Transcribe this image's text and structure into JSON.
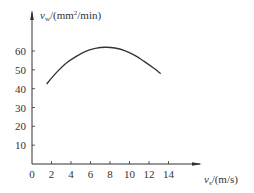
{
  "chart_data": {
    "type": "line",
    "title": "",
    "xlabel": "v_s/(m/s)",
    "ylabel": "v_w/(mm²/min)",
    "xlabel_parts": {
      "symbol": "v",
      "sub": "s",
      "unit": "/(m/s)"
    },
    "ylabel_parts": {
      "symbol": "v",
      "sub": "w",
      "unit_pre": "/(mm",
      "sup": "2",
      "unit_post": "/min)"
    },
    "xlim": [
      0,
      15
    ],
    "ylim": [
      0,
      70
    ],
    "x_ticks": [
      0,
      2,
      4,
      6,
      8,
      10,
      12,
      14
    ],
    "y_ticks": [
      10,
      20,
      30,
      40,
      50,
      60
    ],
    "grid": false,
    "legend": null,
    "series": [
      {
        "name": "v_w vs v_s",
        "x": [
          1.5,
          2.5,
          3.5,
          4.5,
          5.5,
          6.5,
          7.5,
          8.5,
          9.5,
          10.5,
          11.5,
          12.5,
          13.2
        ],
        "y": [
          42.5,
          48.5,
          53.5,
          57.0,
          59.8,
          61.4,
          62.0,
          61.6,
          60.2,
          57.8,
          54.5,
          50.8,
          48.0
        ]
      }
    ],
    "line_color": "#333333"
  }
}
